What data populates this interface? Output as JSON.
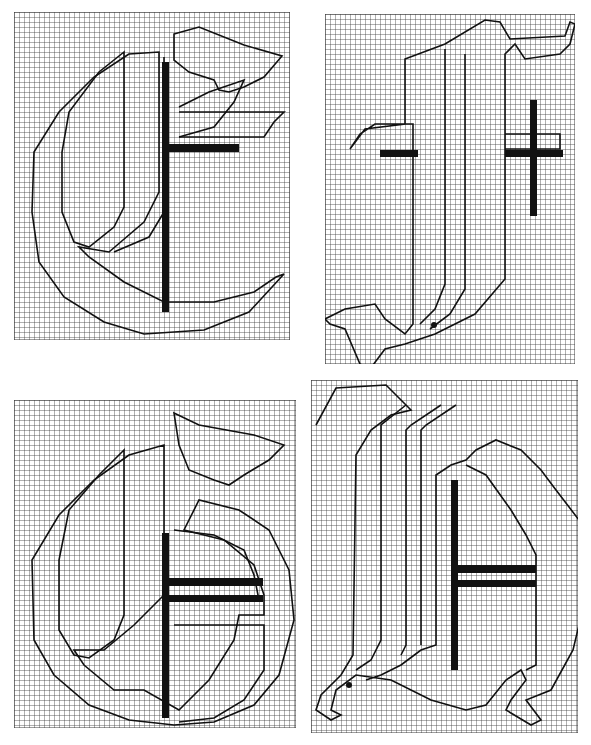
{
  "figure": {
    "background": "#ffffff",
    "grid_color": "#3a3a3a",
    "outline_color": "#111111",
    "bar_color": "#111111",
    "cell_size": 5,
    "panels": [
      {
        "id": "top-left",
        "letter": "C",
        "x": 14,
        "y": 12,
        "w": 276,
        "h": 328,
        "outlines": [
          "M160 22 L185 15 L230 33 L268 44 L250 65 L230 75 L215 80 L205 78 L200 68 L175 60 L160 48 Z",
          "M115 42 L80 65 L45 100 L20 140 L18 200 L25 250 L50 285 L90 310 L130 322 L190 318 L235 300 L270 262 L262 265 L240 280 L200 290 L150 290 L110 270 L75 245 L65 235 L95 240 L130 210 L145 180 L145 40 Z",
          "M110 40 L85 60 L55 100 L48 140 L48 200 L60 230 L75 235 L100 215 L110 195 Z",
          "M150 45 L150 200 L135 225 L100 240",
          "M165 95 L195 80 L230 68 L220 90 L200 115 L165 125",
          "M165 100 L270 100 L260 110 L250 125 L165 125"
        ],
        "bars": [
          {
            "x": 148,
            "y": 50,
            "w": 7,
            "h": 250
          },
          {
            "x": 155,
            "y": 132,
            "w": 70,
            "h": 8
          }
        ]
      },
      {
        "id": "top-right",
        "letter": "T",
        "x": 325,
        "y": 14,
        "w": 250,
        "h": 350,
        "outlines": [
          "M80 45 L120 30 L160 6 L175 8 L185 25 L240 22 L245 8 L250 10 L245 30 L235 40 L200 45 L190 30 L180 40 L180 265 L150 300 L110 320 L80 330 L60 335 L45 355 L35 350 L20 315 L5 310 L0 305 L20 295 L50 290 L60 305 L80 320 L88 310 L88 110 L50 110 L35 120 L25 135 L40 115 L80 110 Z",
          "M120 35 L120 270 L110 295 L95 310",
          "M140 40 L140 275 L125 300 L105 315",
          "M180 120 L235 120 L235 135 L180 135"
        ],
        "bars": [
          {
            "x": 55,
            "y": 136,
            "w": 38,
            "h": 7
          },
          {
            "x": 180,
            "y": 136,
            "w": 58,
            "h": 7
          },
          {
            "x": 205,
            "y": 86,
            "w": 7,
            "h": 116
          }
        ],
        "dots": [
          {
            "x": 109,
            "y": 311,
            "r": 3
          }
        ]
      },
      {
        "id": "bottom-left",
        "letter": "G",
        "x": 14,
        "y": 400,
        "w": 282,
        "h": 328,
        "outlines": [
          "M160 13 L185 25 L240 35 L270 45 L255 60 L230 75 L215 85 L200 80 L175 70 L165 45 Z",
          "M115 55 L80 80 L45 115 L18 160 L20 240 L40 275 L75 305 L115 320 L160 325 L200 322 L240 305 L265 275 L280 220 L275 170 L255 130 L225 110 L185 100 L170 130 L210 140 L240 165 L250 195 L250 215 L225 215 L220 240 L195 280 L165 310 L130 290 L100 290 L70 265 L60 250 L90 250 L120 225 L150 195 L150 45 Z",
          "M110 50 L85 75 L55 110 L45 160 L45 230 L60 255 L75 258 L100 240 L110 215 Z",
          "M160 130 L200 135 L230 150 L240 175 L245 200",
          "M160 225 L250 225 L250 270 L230 300 L200 318 L165 322"
        ],
        "bars": [
          {
            "x": 148,
            "y": 133,
            "w": 7,
            "h": 185
          },
          {
            "x": 155,
            "y": 178,
            "w": 94,
            "h": 8
          },
          {
            "x": 155,
            "y": 195,
            "w": 94,
            "h": 7
          }
        ]
      },
      {
        "id": "bottom-right",
        "letter": "H",
        "x": 311,
        "y": 380,
        "w": 267,
        "h": 353,
        "outlines": [
          "M5 45 L25 8 L75 5 L100 30 L80 35 L60 50 L45 75 L42 275 L30 295 L10 315 L5 330 L20 340 L30 335 L20 330 L25 310 L45 295 L80 300 L120 320 L155 330 L175 325 L195 300 L210 290 L215 300 L200 320 L195 330 L220 345 L230 340 L215 320 L240 310 L262 270 L268 245 L268 140 L245 110 L230 90 L210 70 L185 60 L165 70 L155 80 L140 85 L125 95 L125 265 L110 270 L90 285 L70 295 L55 300",
          "M95 25 L70 45 L70 260 L60 280 L45 290",
          "M130 25 L100 45 L95 50 L95 265 L90 275",
          "M145 25 L115 45 L110 50 L110 265",
          "M155 85 L175 95 L200 130 L215 155 L225 175 L225 285 L215 290"
        ],
        "bars": [
          {
            "x": 140,
            "y": 100,
            "w": 7,
            "h": 190
          },
          {
            "x": 147,
            "y": 185,
            "w": 78,
            "h": 8
          },
          {
            "x": 147,
            "y": 200,
            "w": 78,
            "h": 7
          }
        ],
        "dots": [
          {
            "x": 38,
            "y": 305,
            "r": 3
          }
        ]
      }
    ]
  }
}
